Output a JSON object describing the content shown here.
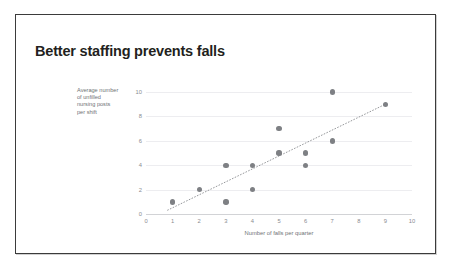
{
  "slide": {
    "title": "Better staffing prevents falls",
    "background_color": "#ffffff",
    "border_color": "#3b3b3b"
  },
  "chart_data": {
    "type": "scatter",
    "title": "Better staffing prevents falls",
    "xlabel": "Number of falls per quarter",
    "ylabel": "Average number of unfilled nursing posts per shift",
    "ylabel_lines": [
      "Average number",
      "of unfilled",
      "nursing posts",
      "per shift"
    ],
    "xlim": [
      0,
      10
    ],
    "ylim": [
      0,
      10
    ],
    "xticks": [
      "0",
      "1",
      "2",
      "3",
      "4",
      "5",
      "6",
      "7",
      "8",
      "9",
      "10"
    ],
    "yticks": [
      "0",
      "2",
      "4",
      "6",
      "8",
      "10"
    ],
    "grid": "horizontal",
    "legend": "none",
    "marker_color": "#7e8084",
    "gridline_color": "#ededf0",
    "axis_color": "#d2d3d6",
    "tick_label_color": "#8a8c90",
    "points": [
      {
        "x": 1,
        "y": 1
      },
      {
        "x": 2,
        "y": 2
      },
      {
        "x": 3,
        "y": 1
      },
      {
        "x": 3,
        "y": 4
      },
      {
        "x": 4,
        "y": 2
      },
      {
        "x": 4,
        "y": 4
      },
      {
        "x": 5,
        "y": 5
      },
      {
        "x": 5,
        "y": 7
      },
      {
        "x": 6,
        "y": 4
      },
      {
        "x": 6,
        "y": 5
      },
      {
        "x": 7,
        "y": 6
      },
      {
        "x": 7,
        "y": 10
      },
      {
        "x": 9,
        "y": 9
      }
    ],
    "trendline": {
      "style": "dotted",
      "color": "#8a8c90",
      "x0": 0.8,
      "y0": 0.3,
      "x1": 9.0,
      "y1": 9.0
    }
  }
}
